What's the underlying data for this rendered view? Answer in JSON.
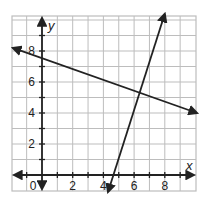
{
  "chart_data": {
    "type": "line",
    "title": "",
    "xlabel": "x",
    "ylabel": "y",
    "xlim": [
      -2,
      10
    ],
    "ylim": [
      -1,
      10.3
    ],
    "grid": true,
    "x_tick_labels": [
      "0",
      "2",
      "4",
      "6",
      "8"
    ],
    "x_tick_values": [
      0,
      2,
      4,
      6,
      8
    ],
    "y_tick_labels": [
      "2",
      "4",
      "6",
      "8"
    ],
    "y_tick_values": [
      2,
      4,
      6,
      8
    ],
    "series": [
      {
        "name": "decreasing line",
        "points": [
          [
            -1.9,
            8.2
          ],
          [
            0,
            7.3
          ],
          [
            10.1,
            4.0
          ]
        ],
        "slope": -0.33,
        "y_intercept": 7.3,
        "arrows": "both",
        "color": "#222222"
      },
      {
        "name": "increasing line",
        "points": [
          [
            4.3,
            -1.1
          ],
          [
            4.65,
            0
          ],
          [
            8.0,
            10.4
          ]
        ],
        "slope": 3.1,
        "x_intercept": 4.65,
        "arrows": "both",
        "color": "#222222"
      }
    ],
    "intersection": [
      6.4,
      5.35
    ]
  },
  "colors": {
    "grid": "#bdbdbd",
    "axis": "#222222",
    "line": "#222222"
  }
}
